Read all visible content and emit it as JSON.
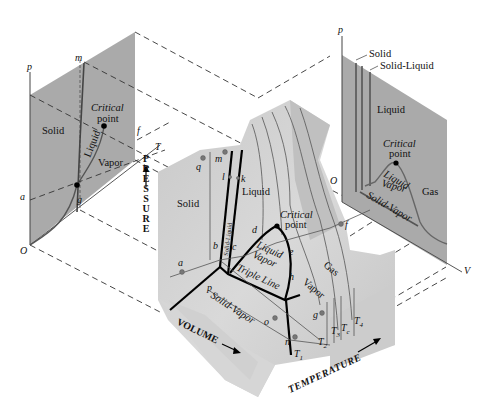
{
  "figure": {
    "type": "3D p-v-T phase surface with projections",
    "axes": {
      "pressure": "PRESSURE",
      "volume": "VOLUME",
      "temperature": "TEMPERATURE"
    },
    "left_projection": {
      "title": "p-T diagram",
      "axis_p": "p",
      "axis_T": "T",
      "origin": "O",
      "regions": [
        "Solid",
        "Liquid",
        "Vapor"
      ],
      "critical_point_line1": "Critical",
      "critical_point_line2": "point",
      "point_labels": [
        "m",
        "f",
        "a",
        "g"
      ]
    },
    "right_projection": {
      "title": "p-V diagram",
      "axis_p": "p",
      "axis_V": "V",
      "origin": "O",
      "regions": [
        "Solid",
        "Solid-Liquid",
        "Liquid",
        "Liquid",
        "Vapor",
        "Gas",
        "Solid-Vapor"
      ],
      "critical_point_line1": "Critical",
      "critical_point_line2": "point"
    },
    "surface": {
      "regions": {
        "solid": "Solid",
        "solid_liquid": "Solid-Liquid",
        "liquid": "Liquid",
        "liquid_vapor_1": "Liquid",
        "liquid_vapor_2": "Vapor",
        "triple_line": "Triple Line",
        "solid_vapor": "Solid-Vapor",
        "vapor": "Vapor",
        "gas": "Gas"
      },
      "critical_point_line1": "Critical",
      "critical_point_line2": "point",
      "state_points": [
        "q",
        "m",
        "l",
        "k",
        "d",
        "b",
        "c",
        "a",
        "e",
        "f",
        "h",
        "p",
        "o",
        "n",
        "g"
      ],
      "isotherms": [
        "T1",
        "T2",
        "T3",
        "Tc",
        "T4"
      ],
      "isotherm_labels": {
        "t1": "T",
        "t1_sub": "1",
        "t2": "T",
        "t2_sub": "2",
        "t3": "T",
        "t3_sub": "3",
        "tc": "T",
        "tc_sub": "c",
        "t4": "T",
        "t4_sub": "4"
      }
    },
    "colors": {
      "surface_light": "#d6d6d6",
      "surface_mid": "#bdbdbd",
      "surface_dark": "#a8a8a8",
      "projection_plane": "#a9a9a9",
      "line": "#000000"
    }
  }
}
